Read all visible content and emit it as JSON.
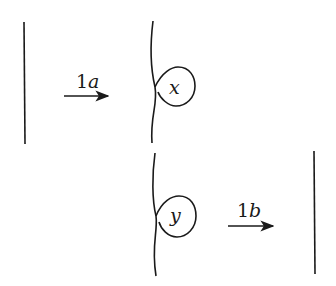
{
  "diagram": {
    "top_row": {
      "left_strand": "straight vertical strand",
      "arrow": {
        "label_num": "1",
        "label_letter": "a",
        "direction": "right"
      },
      "right_strand": {
        "loop_label": "x"
      }
    },
    "bottom_row": {
      "left_strand": {
        "loop_label": "y"
      },
      "arrow": {
        "label_num": "1",
        "label_letter": "b",
        "direction": "right"
      },
      "right_strand": "straight vertical strand"
    },
    "colors": {
      "stroke": "#1a1a1a",
      "background": "#ffffff"
    }
  }
}
